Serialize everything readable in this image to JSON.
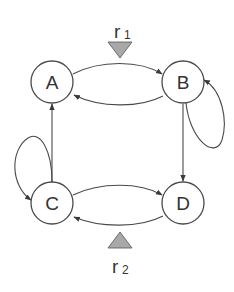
{
  "diagram": {
    "type": "state-transition-diagram",
    "nodes": [
      {
        "id": "A",
        "label": "A",
        "cx": 52,
        "cy": 82
      },
      {
        "id": "B",
        "label": "B",
        "cx": 183,
        "cy": 82
      },
      {
        "id": "C",
        "label": "C",
        "cx": 52,
        "cy": 203
      },
      {
        "id": "D",
        "label": "D",
        "cx": 183,
        "cy": 203
      }
    ],
    "edges": [
      {
        "from": "A",
        "to": "B"
      },
      {
        "from": "B",
        "to": "A"
      },
      {
        "from": "B",
        "to": "B"
      },
      {
        "from": "B",
        "to": "D"
      },
      {
        "from": "C",
        "to": "D"
      },
      {
        "from": "D",
        "to": "C"
      },
      {
        "from": "C",
        "to": "C"
      },
      {
        "from": "C",
        "to": "A"
      }
    ],
    "inputs": [
      {
        "id": "r1",
        "label_main": "r",
        "label_sub": "1",
        "direction": "down",
        "position": "top"
      },
      {
        "id": "r2",
        "label_main": "r",
        "label_sub": "2",
        "direction": "up",
        "position": "bottom"
      }
    ],
    "colors": {
      "stroke": "#4a4a4a",
      "triangle_fill": "#a8a8a8",
      "background": "#ffffff"
    }
  }
}
